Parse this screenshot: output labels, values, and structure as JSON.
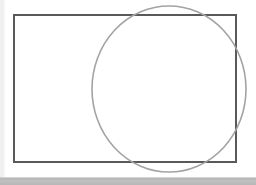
{
  "window": {
    "width": 256,
    "height": 185,
    "background_color": "#ffffff"
  },
  "canvas": {
    "name": "drawing-canvas",
    "background_color": "#ffffff",
    "width": 256,
    "height": 177
  },
  "left_margin_strip": {
    "color": "#f0f0f0",
    "width": 6
  },
  "bottom_bar": {
    "color": "#b9b9b9",
    "height": 8,
    "label": ""
  },
  "shapes": [
    {
      "id": "rectangle",
      "type": "rectangle",
      "x": 13,
      "y": 14,
      "width": 224,
      "height": 149,
      "stroke_color": "#595959",
      "stroke_width": 2,
      "fill": "none"
    },
    {
      "id": "circle",
      "type": "ellipse",
      "cx": 169,
      "cy": 89,
      "rx": 77,
      "ry": 83,
      "stroke_color": "#a3a3a3",
      "stroke_width": 1.6,
      "fill": "none"
    }
  ],
  "overlap": {
    "description": "circle overlaps the right portion of the rectangle and extends beyond its top, right and bottom edges"
  }
}
